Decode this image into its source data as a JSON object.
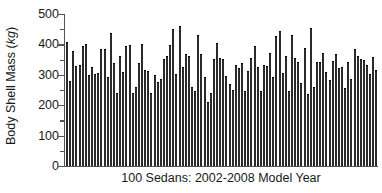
{
  "chart_data": {
    "type": "bar",
    "title": "",
    "subtitle": "",
    "xlabel": "100 Sedans: 2002-2008 Model Year",
    "ylabel": "Body Shell Mass (kg)",
    "ylabel_text": "Body Shell Mass (",
    "ylabel_unit": "kg",
    "ylabel_close": ")",
    "ylim": [
      0,
      500
    ],
    "yticks": [
      0,
      100,
      200,
      300,
      400,
      500
    ],
    "ytick_labels": [
      "0",
      "100",
      "200",
      "300",
      "400",
      "500"
    ],
    "yminor_ticks": [
      50,
      150,
      250,
      350,
      450
    ],
    "grid": false,
    "legend": false,
    "xticks": [],
    "xtick_labels": [],
    "bar_color": "#2b2b2b",
    "axis_color": "#555555",
    "background": "#ffffff",
    "n_bars": 100,
    "categories": [
      "1",
      "2",
      "3",
      "4",
      "5",
      "6",
      "7",
      "8",
      "9",
      "10",
      "11",
      "12",
      "13",
      "14",
      "15",
      "16",
      "17",
      "18",
      "19",
      "20",
      "21",
      "22",
      "23",
      "24",
      "25",
      "26",
      "27",
      "28",
      "29",
      "30",
      "31",
      "32",
      "33",
      "34",
      "35",
      "36",
      "37",
      "38",
      "39",
      "40",
      "41",
      "42",
      "43",
      "44",
      "45",
      "46",
      "47",
      "48",
      "49",
      "50",
      "51",
      "52",
      "53",
      "54",
      "55",
      "56",
      "57",
      "58",
      "59",
      "60",
      "61",
      "62",
      "63",
      "64",
      "65",
      "66",
      "67",
      "68",
      "69",
      "70",
      "71",
      "72",
      "73",
      "74",
      "75",
      "76",
      "77",
      "78",
      "79",
      "80",
      "81",
      "82",
      "83",
      "84",
      "85",
      "86",
      "87",
      "88",
      "89",
      "90",
      "91",
      "92",
      "93",
      "94",
      "95",
      "96",
      "97",
      "98",
      "99",
      "100"
    ],
    "values": [
      405,
      278,
      375,
      325,
      330,
      390,
      397,
      295,
      322,
      300,
      302,
      382,
      380,
      288,
      434,
      335,
      237,
      360,
      306,
      393,
      395,
      236,
      258,
      335,
      399,
      312,
      308,
      237,
      296,
      272,
      283,
      350,
      357,
      395,
      449,
      300,
      458,
      322,
      364,
      360,
      258,
      245,
      429,
      364,
      288,
      207,
      238,
      348,
      403,
      352,
      348,
      294,
      268,
      248,
      330,
      320,
      336,
      245,
      310,
      352,
      390,
      322,
      245,
      328,
      325,
      367,
      290,
      426,
      441,
      302,
      360,
      243,
      427,
      352,
      340,
      270,
      385,
      235,
      450,
      256,
      338,
      340,
      367,
      306,
      280,
      342,
      365,
      320,
      322,
      252,
      340,
      282,
      383,
      360,
      348,
      345,
      330,
      300,
      355,
      312
    ]
  }
}
